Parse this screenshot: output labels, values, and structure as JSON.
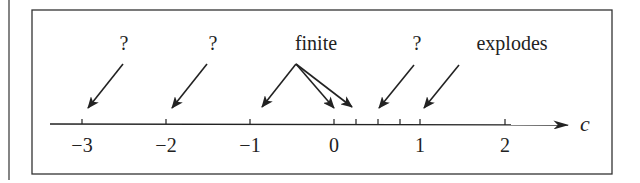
{
  "diagram": {
    "axis": {
      "variable": "c",
      "ticks": [
        {
          "value": -3,
          "label": "−3",
          "x": 82
        },
        {
          "value": -2,
          "label": "−2",
          "x": 166
        },
        {
          "value": -1,
          "label": "−1",
          "x": 250
        },
        {
          "value": 0,
          "label": "0",
          "x": 334
        },
        {
          "value": 1,
          "label": "1",
          "x": 420
        },
        {
          "value": 2,
          "label": "2",
          "x": 505
        }
      ],
      "minor_ticks": [
        0.25,
        0.5,
        0.75
      ]
    },
    "annotations": [
      {
        "label": "?",
        "points_to": [
          -3
        ]
      },
      {
        "label": "?",
        "points_to": [
          -2
        ]
      },
      {
        "label": "finite",
        "points_to": [
          -1,
          0,
          0.25
        ]
      },
      {
        "label": "?",
        "points_to": [
          0.5
        ]
      },
      {
        "label": "explodes",
        "points_to": [
          1
        ]
      }
    ],
    "colors": {
      "stroke": "#222222",
      "background": "#ffffff"
    }
  }
}
